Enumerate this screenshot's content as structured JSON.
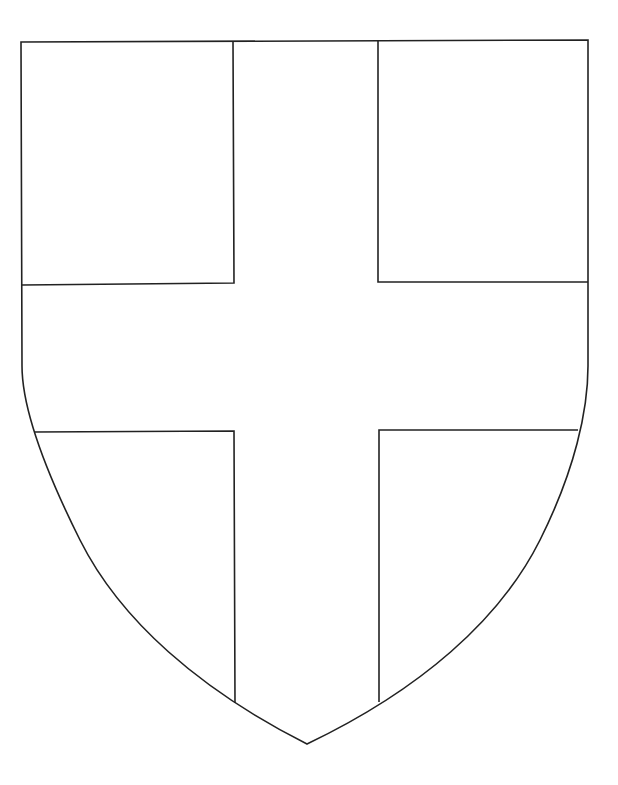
{
  "figure": {
    "colors": {
      "background": "#ffffff",
      "line": "#222222",
      "fill": "#ffffff"
    },
    "shield": {
      "top_left": [
        21,
        42
      ],
      "top_right": [
        588,
        40
      ],
      "straight_sides_end_y": 375,
      "bottom_point": [
        307,
        744
      ]
    },
    "cross": {
      "vertical_left_x": 234,
      "vertical_right_x": 378,
      "horizontal_top_y": 283,
      "horizontal_bottom_y": 431
    },
    "regions": [
      {
        "name": "top-left-quarter"
      },
      {
        "name": "top-right-quarter"
      },
      {
        "name": "bottom-left-quarter"
      },
      {
        "name": "bottom-right-quarter"
      },
      {
        "name": "cross"
      }
    ]
  }
}
